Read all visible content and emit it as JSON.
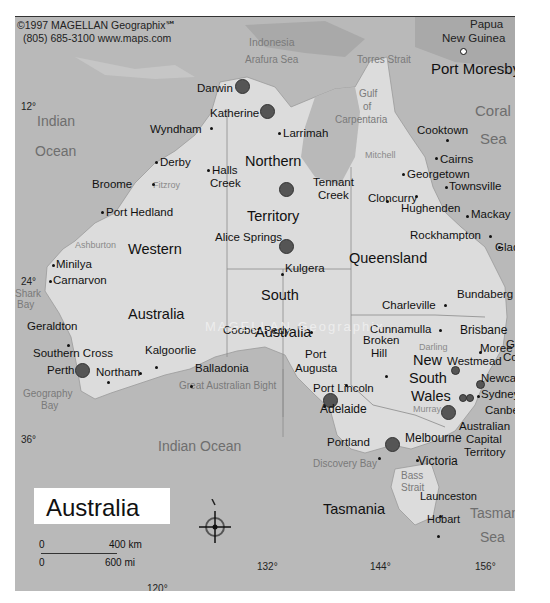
{
  "map": {
    "title": "Australia",
    "copyright_line1": "©1997 MAGELLAN Geographix℠",
    "copyright_line2": "(805) 685-3100  www.maps.com",
    "watermark": "MAGELLAN Geographix",
    "colors": {
      "ocean": "#b9b9b9",
      "land": "#dcdcdc",
      "neighbor_land": "#a9a9a9",
      "text": "#111111"
    }
  },
  "coords": {
    "lat_12": "12°",
    "lat_24": "24°",
    "lat_36": "36°",
    "lon_120": "120°",
    "lon_132": "132°",
    "lon_144": "144°",
    "lon_156": "156°"
  },
  "water": {
    "indian": "Indian",
    "ocean": "Ocean",
    "indian_ocean_south": "Indian Ocean",
    "coral": "Coral",
    "coral_sea": "Sea",
    "tasman": "Tasman",
    "tasman_sea": "Sea",
    "arafura": "Arafura Sea",
    "torres": "Torres Strait",
    "gulf1": "Gulf",
    "gulf2": "of",
    "gulf3": "Carpentaria",
    "bight": "Great Australian Bight",
    "geography1": "Geography",
    "geography2": "Bay",
    "shark1": "Shark",
    "shark2": "Bay",
    "discovery": "Discovery Bay",
    "bass1": "Bass",
    "bass2": "Strait"
  },
  "rivers": {
    "fitzroy": "Fitzroy",
    "ashburton": "Ashburton",
    "mitchell": "Mitchell",
    "darling": "Darling",
    "murray": "Murray"
  },
  "regions": {
    "indonesia": "Indonesia",
    "png1": "Papua",
    "png2": "New Guinea",
    "nt1": "Northern",
    "nt2": "Territory",
    "wa1": "Western",
    "wa2": "Australia",
    "qld": "Queensland",
    "sa1": "South",
    "sa2": "Australia",
    "nsw1": "New",
    "nsw2": "South",
    "nsw3": "Wales",
    "vic": "Victoria",
    "tas": "Tasmania",
    "act1": "Australian",
    "act2": "Capital",
    "act3": "Territory"
  },
  "cities": {
    "port_moresby": "Port Moresby",
    "darwin": "Darwin",
    "katherine": "Katherine",
    "wyndham": "Wyndham",
    "larrimah": "Larrimah",
    "cooktown": "Cooktown",
    "cairns": "Cairns",
    "georgetown": "Georgetown",
    "townsville": "Townsville",
    "broome": "Broome",
    "derby": "Derby",
    "halls1": "Halls",
    "halls2": "Creek",
    "tennant1": "Tennant",
    "tennant2": "Creek",
    "cloncurry": "Cloncurry",
    "hughenden": "Hughenden",
    "mackay": "Mackay",
    "port_hedland": "Port Hedland",
    "rockhampton": "Rockhampton",
    "gladstone": "Gladstone",
    "alice": "Alice Springs",
    "kulgera": "Kulgera",
    "minilya": "Minilya",
    "carnarvon": "Carnarvon",
    "charleville": "Charleville",
    "bundaberg": "Bundaberg",
    "geraldton": "Geraldton",
    "coober": "Coober Pedy",
    "cunnamulla": "Cunnamulla",
    "brisbane": "Brisbane",
    "gold1": "Gold",
    "gold2": "Coast",
    "southern_cross": "Southern Cross",
    "kalgoorlie": "Kalgoorlie",
    "broken1": "Broken",
    "broken2": "Hill",
    "moree": "Moree",
    "westmead": "Westmead",
    "perth": "Perth",
    "northam": "Northam",
    "balladonia": "Balladonia",
    "port_augusta1": "Port",
    "port_augusta2": "Augusta",
    "newcastle": "Newcastle",
    "port_lincoln": "Port Lincoln",
    "sydney": "Sydney(2)",
    "adelaide": "Adelaide",
    "canberra": "Canberra",
    "portland": "Portland",
    "melbourne": "Melbourne",
    "launceston": "Launceston",
    "hobart": "Hobart"
  },
  "scale": {
    "km_zero": "0",
    "km_value": "400 km",
    "mi_zero": "0",
    "mi_value": "600 mi"
  },
  "compass": {
    "north_label": "N"
  }
}
